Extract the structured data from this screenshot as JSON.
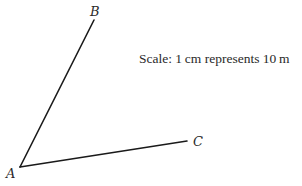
{
  "diagram": {
    "type": "angle-construction",
    "points": {
      "A": {
        "label": "A",
        "x": 20,
        "y": 167
      },
      "B": {
        "label": "B",
        "x": 94,
        "y": 20
      },
      "C": {
        "label": "C",
        "x": 187,
        "y": 141
      }
    },
    "segments": [
      {
        "from": "A",
        "to": "B"
      },
      {
        "from": "A",
        "to": "C"
      }
    ],
    "scale_note": "Scale: 1 cm represents 10 m",
    "line_color": "#1a1a1a",
    "text_color": "#2a2a2a"
  }
}
